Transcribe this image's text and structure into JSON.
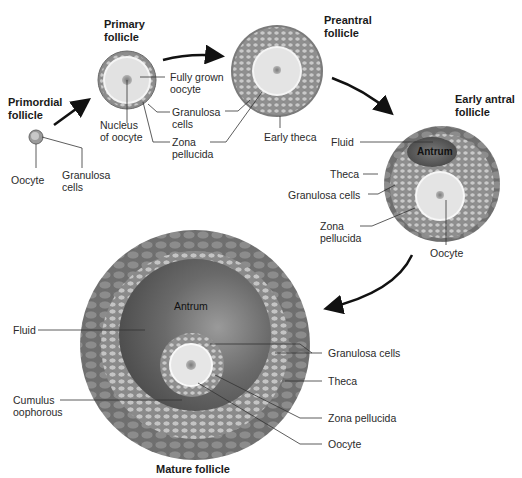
{
  "diagram": {
    "type": "biology-stages",
    "colors": {
      "theca": "#7a7a7a",
      "granulosa_fill": "#9a9a9a",
      "granulosa_cell": "#c6c6c6",
      "oocyte": "#e9e9e9",
      "zona": "#f7f7f7",
      "nucleus": "#8e8e8e",
      "antrum": "#5f5f5f",
      "arrow": "#111111",
      "leader": "#333333"
    },
    "stages": [
      {
        "title": "Primordial\nfollicle",
        "labels": [
          "Oocyte",
          "Granulosa\ncells"
        ]
      },
      {
        "title": "Primary\nfollicle",
        "labels": [
          "Fully grown\noocyte",
          "Granulosa\ncells",
          "Zona\npellucida",
          "Nucleus\nof oocyte"
        ]
      },
      {
        "title": "Preantral\nfollicle",
        "labels": [
          "Early theca"
        ]
      },
      {
        "title": "Early antral\nfollicle",
        "labels": [
          "Fluid",
          "Antrum",
          "Theca",
          "Granulosa cells",
          "Zona\npellucida",
          "Oocyte"
        ]
      },
      {
        "title": "Mature follicle",
        "labels": [
          "Antrum",
          "Fluid",
          "Granulosa cells",
          "Theca",
          "Cumulus\noophorous",
          "Zona pellucida",
          "Oocyte"
        ]
      }
    ]
  }
}
